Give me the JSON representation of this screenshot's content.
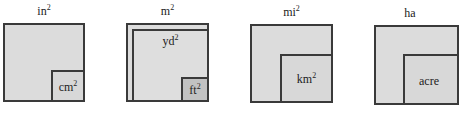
{
  "panels": [
    {
      "title": {
        "base": "in",
        "exp": "2"
      },
      "inner": {
        "base": "cm",
        "exp": "2"
      }
    },
    {
      "title": {
        "base": "m",
        "exp": "2"
      },
      "middle": {
        "base": "yd",
        "exp": "2"
      },
      "inner": {
        "base": "ft",
        "exp": "2"
      }
    },
    {
      "title": {
        "base": "mi",
        "exp": "2"
      },
      "inner": {
        "base": "km",
        "exp": "2"
      }
    },
    {
      "title": {
        "base": "ha",
        "exp": ""
      },
      "inner": {
        "base": "acre",
        "exp": ""
      }
    }
  ],
  "colors": {
    "fill": "#dcdcdc",
    "inner_dark_fill": "#c2c2c2",
    "border": "#3a3a3a"
  }
}
